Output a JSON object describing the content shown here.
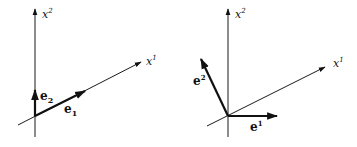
{
  "figure": {
    "left_panel": {
      "title": "covariant basis",
      "axes": {
        "vertical_label": "x",
        "vertical_index": "2",
        "oblique_label": "x",
        "oblique_index": "1"
      },
      "vectors": [
        {
          "name": "e",
          "index": "2",
          "index_position": "subscript"
        },
        {
          "name": "e",
          "index": "1",
          "index_position": "subscript"
        }
      ]
    },
    "right_panel": {
      "title": "contravariant basis",
      "axes": {
        "vertical_label": "x",
        "vertical_index": "2",
        "oblique_label": "x",
        "oblique_index": "1"
      },
      "vectors": [
        {
          "name": "e",
          "index": "2",
          "index_position": "superscript"
        },
        {
          "name": "e",
          "index": "1",
          "index_position": "superscript"
        }
      ]
    },
    "colors": {
      "ink": "#111111",
      "background": "#ffffff"
    }
  }
}
